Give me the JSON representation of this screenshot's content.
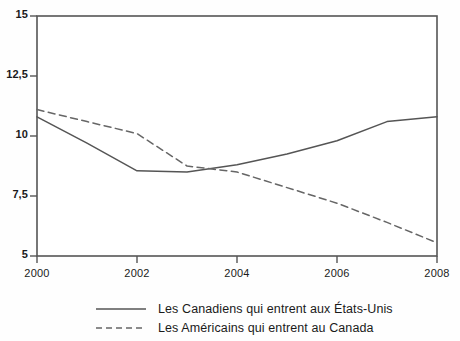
{
  "chart_data": {
    "type": "line",
    "title": "",
    "xlabel": "",
    "ylabel": "",
    "x": [
      2000,
      2001,
      2002,
      2003,
      2004,
      2005,
      2006,
      2007,
      2008
    ],
    "xlim": [
      2000,
      2008
    ],
    "ylim": [
      5,
      15
    ],
    "grid": false,
    "legend_position": "bottom",
    "xticks": [
      "2000",
      "2002",
      "2004",
      "2006",
      "2008"
    ],
    "xtick_values": [
      2000,
      2002,
      2004,
      2006,
      2008
    ],
    "yticks": [
      "5",
      "7,5",
      "10",
      "12,5",
      "15"
    ],
    "ytick_values": [
      5,
      7.5,
      10,
      12.5,
      15
    ],
    "series": [
      {
        "name": "Les Canadiens qui entrent aux États-Unis",
        "style": "solid",
        "color": "#555555",
        "values": [
          10.8,
          9.7,
          8.55,
          8.5,
          8.8,
          9.25,
          9.8,
          10.6,
          10.8
        ]
      },
      {
        "name": "Les Américains qui entrent au Canada",
        "style": "dashed",
        "color": "#666666",
        "values": [
          11.1,
          10.6,
          10.1,
          8.75,
          8.5,
          7.85,
          7.2,
          6.4,
          5.55
        ]
      }
    ]
  },
  "legend": {
    "items": [
      {
        "label": "Les Canadiens qui entrent aux États-Unis",
        "style": "solid"
      },
      {
        "label": "Les Américains qui entrent au Canada",
        "style": "dashed"
      }
    ]
  },
  "axes": {
    "frame_color": "#555555"
  }
}
